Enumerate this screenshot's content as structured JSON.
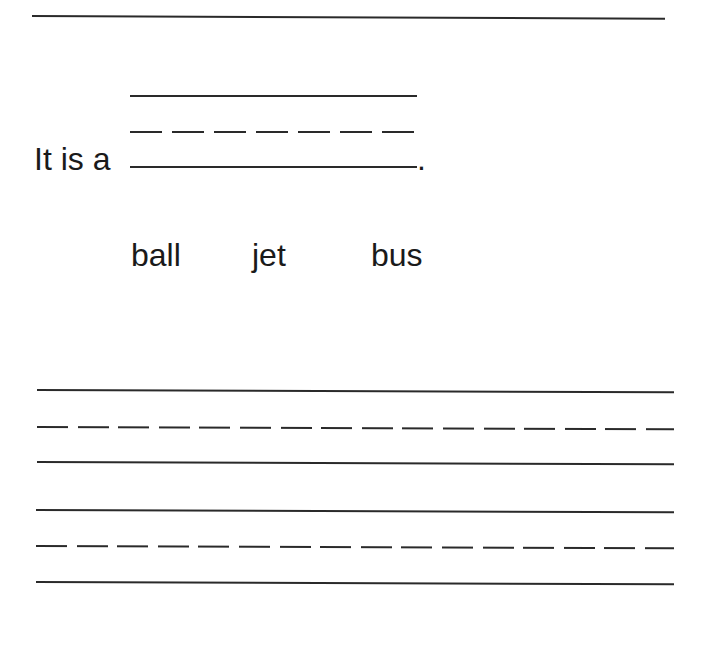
{
  "worksheet": {
    "name_line": {
      "label": ""
    },
    "sentence": {
      "prefix": "It is a",
      "answer": "",
      "suffix": "."
    },
    "word_choices": [
      "ball",
      "jet",
      "bus"
    ],
    "writing_rows": [
      {
        "value": ""
      },
      {
        "value": ""
      }
    ]
  }
}
